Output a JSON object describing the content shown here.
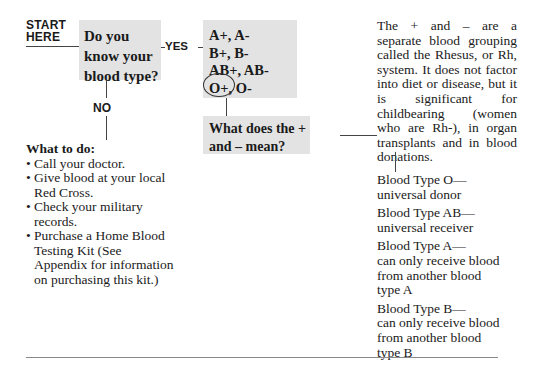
{
  "start_label": {
    "line1": "START",
    "line2": "HERE"
  },
  "question1": "Do you know your blood type?",
  "yes_label": "YES",
  "no_label": "NO",
  "blood_types": [
    "A+, A-",
    "B+, B-",
    "AB+, AB-",
    "O+, O-"
  ],
  "circled_type": "O+",
  "question2": "What does the + and – mean?",
  "what_to_do": {
    "heading": "What to do:",
    "items": [
      "Call your doctor.",
      "Give blood at your local Red Cross.",
      "Check your military records.",
      "Purchase a Home Blood Testing Kit (See Appendix for information on purchasing this kit.)"
    ]
  },
  "rh_explanation": "The + and – are a separate blood grouping called the Rhesus, or Rh, system. It does not factor into diet or disease, but it is significant for childbearing (women who are Rh-), in organ transplants and in blood donations.",
  "type_notes": [
    {
      "title": "Blood Type O—",
      "desc": "universal donor"
    },
    {
      "title": "Blood Type AB—",
      "desc": "universal receiver"
    },
    {
      "title": "Blood Type A—",
      "desc": "can only receive blood from another blood type A"
    },
    {
      "title": "Blood Type B—",
      "desc": "can only receive blood from another blood type B"
    }
  ]
}
